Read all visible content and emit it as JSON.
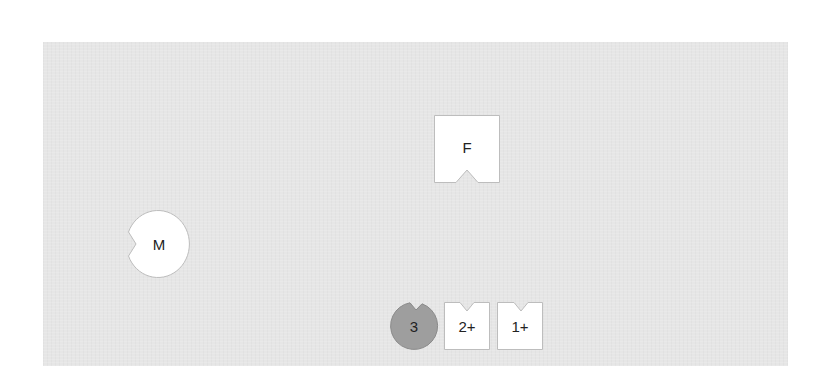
{
  "diagram": {
    "background_color": "#e6e6e6",
    "shapes": [
      {
        "id": "F",
        "label": "F",
        "form": "square-with-bottom-notch",
        "fill": "#ffffff",
        "stroke": "#bdbdbd"
      },
      {
        "id": "M",
        "label": "M",
        "form": "circle-with-left-notch",
        "fill": "#ffffff",
        "stroke": "#bdbdbd"
      },
      {
        "id": "ion-3",
        "label": "3",
        "form": "circle-with-top-notch",
        "fill": "#9e9e9e",
        "stroke": "#8a8a8a"
      },
      {
        "id": "ion-2plus",
        "label": "2+",
        "form": "square-with-top-notch",
        "fill": "#ffffff",
        "stroke": "#bdbdbd"
      },
      {
        "id": "ion-1plus",
        "label": "1+",
        "form": "square-with-top-notch",
        "fill": "#ffffff",
        "stroke": "#bdbdbd"
      }
    ]
  }
}
